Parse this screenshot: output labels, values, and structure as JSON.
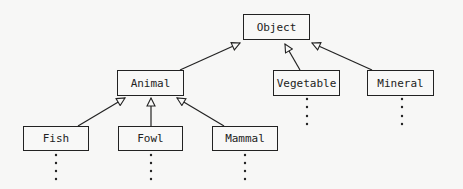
{
  "diagram": {
    "type": "class-hierarchy",
    "nodes": [
      {
        "id": "object",
        "label": "Object",
        "x": 243,
        "y": 14,
        "w": 67,
        "h": 26
      },
      {
        "id": "animal",
        "label": "Animal",
        "x": 117,
        "y": 70,
        "w": 67,
        "h": 26
      },
      {
        "id": "vegetable",
        "label": "Vegetable",
        "x": 273,
        "y": 70,
        "w": 67,
        "h": 26
      },
      {
        "id": "mineral",
        "label": "Mineral",
        "x": 367,
        "y": 70,
        "w": 67,
        "h": 26
      },
      {
        "id": "fish",
        "label": "Fish",
        "x": 23,
        "y": 126,
        "w": 66,
        "h": 25
      },
      {
        "id": "fowl",
        "label": "Fowl",
        "x": 118,
        "y": 126,
        "w": 65,
        "h": 25
      },
      {
        "id": "mammal",
        "label": "Mammal",
        "x": 212,
        "y": 126,
        "w": 66,
        "h": 25
      }
    ],
    "edges": [
      {
        "from": "animal",
        "to": "object",
        "kind": "inheritance"
      },
      {
        "from": "vegetable",
        "to": "object",
        "kind": "inheritance"
      },
      {
        "from": "mineral",
        "to": "object",
        "kind": "inheritance"
      },
      {
        "from": "fish",
        "to": "animal",
        "kind": "inheritance"
      },
      {
        "from": "fowl",
        "to": "animal",
        "kind": "inheritance"
      },
      {
        "from": "mammal",
        "to": "animal",
        "kind": "inheritance"
      }
    ],
    "continuations": [
      "vegetable",
      "mineral",
      "fish",
      "fowl",
      "mammal"
    ],
    "colors": {
      "line": "#222222",
      "background": "#f7f7f6"
    }
  }
}
